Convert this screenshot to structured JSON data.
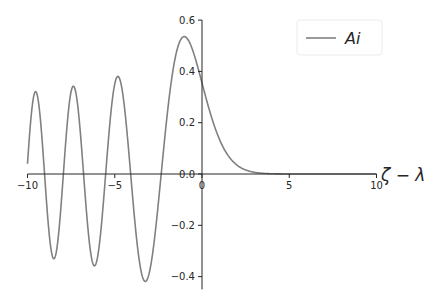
{
  "chart_data": {
    "type": "line",
    "title": "",
    "xlabel": "ζ − λ",
    "ylabel": "",
    "xlim": [
      -10,
      10
    ],
    "ylim": [
      -0.45,
      0.6
    ],
    "grid": false,
    "legend_position": "upper right",
    "x_ticks": [
      -10,
      -5,
      0,
      5,
      10
    ],
    "x_tick_labels": [
      "−10",
      "−5",
      "0",
      "5",
      "10"
    ],
    "y_ticks": [
      0.6,
      0.4,
      0.2,
      0.0,
      -0.2,
      -0.4
    ],
    "y_tick_labels": [
      "0.6",
      "0.4",
      "0.2",
      "0.0",
      "−0.2",
      "−0.4"
    ],
    "series": [
      {
        "name": "Ai",
        "function": "Airy Ai(x)",
        "color": "#808080",
        "x": [
          -10,
          -9.5,
          -9,
          -8.5,
          -8,
          -7.5,
          -7,
          -6.5,
          -6,
          -5.5,
          -5,
          -4.5,
          -4,
          -3.5,
          -3,
          -2.5,
          -2,
          -1.5,
          -1,
          -0.5,
          0,
          0.5,
          1,
          1.5,
          2,
          2.5,
          3,
          4,
          5,
          6,
          8,
          10
        ],
        "values": [
          0.042,
          0.217,
          -0.022,
          -0.313,
          0.053,
          0.32,
          -0.133,
          -0.318,
          0.147,
          0.363,
          0.351,
          0.145,
          -0.07,
          -0.376,
          -0.379,
          -0.112,
          0.227,
          0.464,
          0.536,
          0.476,
          0.355,
          0.232,
          0.135,
          0.072,
          0.035,
          0.016,
          0.007,
          0.001,
          0.0001,
          1e-05,
          0.0,
          0.0
        ]
      }
    ]
  },
  "legend": {
    "label": "Ai"
  },
  "axes": {
    "xlabel": "ζ − λ"
  }
}
